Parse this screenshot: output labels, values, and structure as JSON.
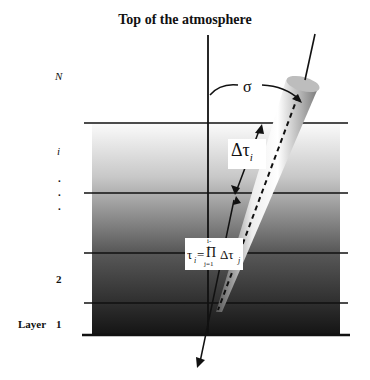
{
  "diagram": {
    "title": "Top of the atmosphere",
    "layer_labels": {
      "top": "N",
      "middle": "i",
      "dots": ".",
      "second": "2",
      "first_prefix": "Layer",
      "first": "1"
    },
    "symbols": {
      "zenith_angle": "σ",
      "delta_tau": "Δτ",
      "delta_tau_sub": "i",
      "tau_formula": {
        "lhs": "τ",
        "lhs_sub": "i",
        "equals": "=",
        "product": "Π",
        "upper": "i-1",
        "lower": "j=1",
        "rhs": "Δτ",
        "rhs_sub": "j"
      }
    },
    "colors": {
      "gradient_top": "#ffffff",
      "gradient_bottom": "#111111",
      "lines": "#111111"
    }
  }
}
